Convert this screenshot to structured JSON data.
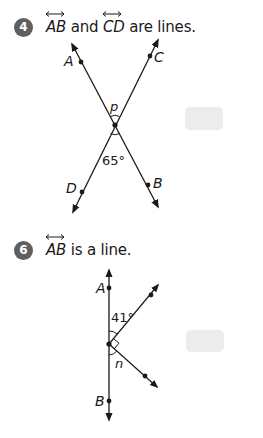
{
  "problems": [
    {
      "number": "4",
      "prompt": {
        "line1": "AB",
        "connector": "and",
        "line2": "CD",
        "suffix": "are lines."
      },
      "figure": {
        "points": {
          "A": "A",
          "B": "B",
          "C": "C",
          "D": "D"
        },
        "unknown_angle_label": "p",
        "known_angle_label": "65°"
      },
      "answer_box": ""
    },
    {
      "number": "6",
      "prompt": {
        "line1": "AB",
        "suffix": "is a line."
      },
      "figure": {
        "points": {
          "A": "A",
          "B": "B"
        },
        "known_angle_label": "41°",
        "unknown_angle_label": "n",
        "right_angle_marker": true
      },
      "answer_box": ""
    }
  ],
  "colors": {
    "badge": "#5f5f5f",
    "ink": "#1a1a1a",
    "answer_box": "#ececec"
  }
}
